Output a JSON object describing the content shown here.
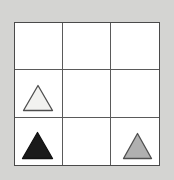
{
  "figure": {
    "kind": "matrix-grid",
    "rows": 3,
    "columns": 3,
    "background_color": "#d4d4d2",
    "cell_background_color": "#ffffff",
    "grid_line_color": "#5a5a5a",
    "grid_border_color": "#4a4a4a"
  },
  "shape_styles": {
    "white": {
      "name": "white-triangle",
      "fill": "#f2f2f0",
      "stroke": "#4f4f4f"
    },
    "black": {
      "name": "black-triangle",
      "fill": "#1a1a1a",
      "stroke": "#111111"
    },
    "gray": {
      "name": "gray-triangle",
      "fill": "#b0b0b0",
      "stroke": "#4f4f4f"
    }
  },
  "cells": [
    {
      "id": "r1c1",
      "row": 1,
      "column": 1,
      "shape": null,
      "shape_color": null,
      "label": ""
    },
    {
      "id": "r1c2",
      "row": 1,
      "column": 2,
      "shape": null,
      "shape_color": null,
      "label": ""
    },
    {
      "id": "r1c3",
      "row": 1,
      "column": 3,
      "shape": null,
      "shape_color": null,
      "label": ""
    },
    {
      "id": "r2c1",
      "row": 2,
      "column": 1,
      "shape": "triangle",
      "shape_color": "white",
      "label": ""
    },
    {
      "id": "r2c2",
      "row": 2,
      "column": 2,
      "shape": null,
      "shape_color": null,
      "label": ""
    },
    {
      "id": "r2c3",
      "row": 2,
      "column": 3,
      "shape": null,
      "shape_color": null,
      "label": ""
    },
    {
      "id": "r3c1",
      "row": 3,
      "column": 1,
      "shape": "triangle",
      "shape_color": "black",
      "label": ""
    },
    {
      "id": "r3c2",
      "row": 3,
      "column": 2,
      "shape": null,
      "shape_color": null,
      "label": ""
    },
    {
      "id": "r3c3",
      "row": 3,
      "column": 3,
      "shape": "triangle",
      "shape_color": "gray",
      "label": ""
    }
  ]
}
